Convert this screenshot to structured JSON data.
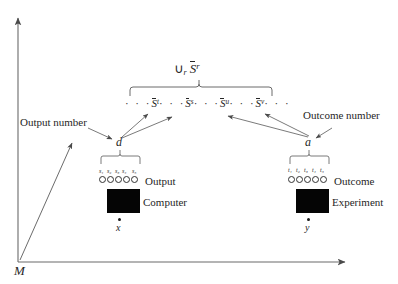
{
  "figure": {
    "axes": {
      "origin_label": "M",
      "y_axis_name": "vertical-axis",
      "x_axis_name": "horizontal-axis"
    },
    "union_label": {
      "operator": "∪",
      "operator_subscript": "r",
      "set_symbol": "S",
      "set_superscript": "r"
    },
    "set_sequence": {
      "leading_dots": "· · ·",
      "items": [
        {
          "symbol": "S",
          "superscript": "t"
        },
        {
          "symbol": "S",
          "superscript": "s"
        },
        {
          "symbol": "S",
          "superscript": "u"
        },
        {
          "symbol": "S",
          "superscript": "v"
        }
      ],
      "separator_dots": "· · ·",
      "trailing_dots": "· · ·"
    },
    "annotations": {
      "left_callout": "Output number",
      "right_callout": "Outcome number"
    },
    "left_group": {
      "node_label": "d",
      "slot_labels": [
        "s₁",
        "s₂",
        "s₃",
        "s₄",
        "s₅"
      ],
      "slot_base": "s",
      "slot_indices": [
        "1",
        "2",
        "3",
        "4",
        "5"
      ],
      "row_label": "Output",
      "box_label": "Computer",
      "input_label": "x"
    },
    "right_group": {
      "node_label": "a",
      "slot_labels": [
        "t₁",
        "t₂",
        "t₃",
        "t₄",
        "t₅"
      ],
      "slot_base": "t",
      "slot_indices": [
        "1",
        "2",
        "3",
        "4",
        "5"
      ],
      "row_label": "Outcome",
      "box_label": "Experiment",
      "input_label": "y"
    },
    "colors": {
      "ink": "#262626",
      "line": "#555555",
      "box_fill": "#050505",
      "background": "#ffffff"
    }
  }
}
